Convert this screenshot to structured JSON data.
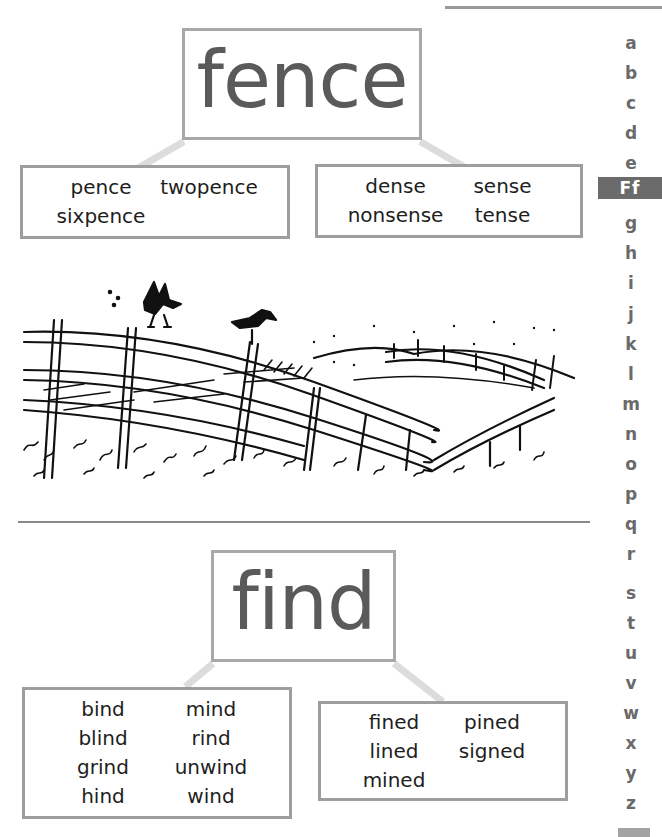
{
  "sections": [
    {
      "headword": "fence",
      "groups": [
        {
          "words": [
            "pence",
            "twopence",
            "sixpence"
          ]
        },
        {
          "words": [
            "dense",
            "sense",
            "nonsense",
            "tense"
          ]
        }
      ]
    },
    {
      "headword": "find",
      "groups": [
        {
          "words": [
            "bind",
            "mind",
            "blind",
            "rind",
            "grind",
            "unwind",
            "hind",
            "wind"
          ]
        },
        {
          "words": [
            "fined",
            "pined",
            "lined",
            "signed",
            "mined"
          ]
        }
      ]
    }
  ],
  "illustration": {
    "description": "Pen sketch of a rustic wooden fence on grassy hills with two birds",
    "icon": "fence-illustration"
  },
  "alphabet_index": {
    "letters": [
      "a",
      "b",
      "c",
      "d",
      "e",
      "Ff",
      "g",
      "h",
      "i",
      "j",
      "k",
      "l",
      "m",
      "n",
      "o",
      "p",
      "q",
      "r",
      "s",
      "t",
      "u",
      "v",
      "w",
      "x",
      "y",
      "z"
    ],
    "current": "Ff",
    "current_bg": "#6b6b6b",
    "letter_color": "#6a6a6a"
  },
  "colors": {
    "headword_text": "#5a5a5a",
    "box_border": "#a8a8a8",
    "connector": "#dcdcdc"
  }
}
